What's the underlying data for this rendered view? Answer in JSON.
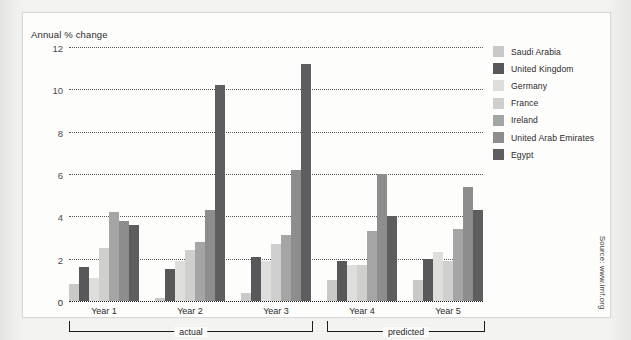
{
  "chart_data": {
    "type": "bar",
    "title": "",
    "ylabel": "Annual % change",
    "xlabel": "",
    "ylim": [
      0,
      12
    ],
    "yticks": [
      0,
      2,
      4,
      6,
      8,
      10,
      12
    ],
    "grid": true,
    "legend_position": "right",
    "categories": [
      "Year 1",
      "Year 2",
      "Year 3",
      "Year 4",
      "Year 5"
    ],
    "series": [
      {
        "name": "Saudi Arabia",
        "color": "#c9c9c7",
        "values": [
          0.8,
          0.15,
          0.4,
          1.0,
          1.0
        ]
      },
      {
        "name": "United Kingdom",
        "color": "#58585a",
        "values": [
          1.6,
          1.5,
          2.1,
          1.9,
          2.0
        ]
      },
      {
        "name": "Germany",
        "color": "#dedeDC",
        "values": [
          1.1,
          1.9,
          1.9,
          1.7,
          2.3
        ]
      },
      {
        "name": "France",
        "color": "#cfcfcd",
        "values": [
          2.5,
          2.4,
          2.7,
          1.7,
          1.9
        ]
      },
      {
        "name": "Ireland",
        "color": "#a5a5a5",
        "values": [
          4.2,
          2.8,
          3.1,
          3.3,
          3.4
        ]
      },
      {
        "name": "United Arab Emirates",
        "color": "#8d8d8d",
        "values": [
          3.8,
          4.3,
          6.2,
          6.0,
          5.4
        ]
      },
      {
        "name": "Egypt",
        "color": "#5e5e60",
        "values": [
          3.6,
          10.2,
          11.2,
          4.0,
          4.3
        ]
      }
    ],
    "annotations": [
      {
        "label": "actual",
        "spans": [
          "Year 1",
          "Year 2",
          "Year 3"
        ]
      },
      {
        "label": "predicted",
        "spans": [
          "Year 4",
          "Year 5"
        ]
      }
    ],
    "source": "Source: www.imf.org"
  }
}
